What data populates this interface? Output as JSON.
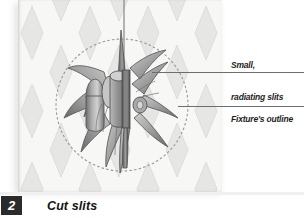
{
  "figure": {
    "step_number": "2",
    "caption": "Cut slits"
  },
  "callouts": [
    {
      "id": "small-radiating-slits",
      "line1": "Small,",
      "line2": "radiating slits"
    },
    {
      "id": "fixtures-outline",
      "line1": "Fixture's outline",
      "line2": ""
    }
  ],
  "illustration": {
    "background_pattern": "diamond-lozenge-wallpaper",
    "guide_shape": "dashed-circle",
    "hanging_wire": "vertical-line",
    "fixture": "radiating-star-light-fixture"
  },
  "colors": {
    "paper": "#f7f7f6",
    "diamond": "#e3e3e1",
    "ink_dark": "#4a4a4a",
    "ink_mid": "#8c8c8c",
    "ink_light": "#bdbdbd",
    "badge_bg": "#2b2b2b",
    "badge_text": "#ffffff",
    "leader_line": "#6e6e6e",
    "text": "#1d1d1d"
  }
}
